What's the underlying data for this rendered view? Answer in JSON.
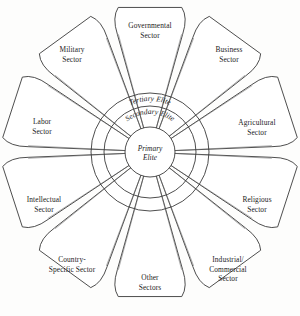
{
  "diagram": {
    "type": "radial-petal-diagram",
    "center": {
      "x": 150,
      "y": 152
    },
    "background_color": "#fdfdfc",
    "line_color": "#3a3a3a",
    "spoke_color": "#6e6e6e",
    "text_color": "#1c1c1c",
    "rings": [
      {
        "id": "tertiary",
        "label": "Tertiary Elite",
        "radius": 59,
        "label_arc_radius": 51,
        "order": 3
      },
      {
        "id": "secondary",
        "label": "Secondary Elite",
        "radius": 46,
        "label_arc_radius": 38,
        "order": 2
      },
      {
        "id": "primary",
        "label_line1": "Primary",
        "label_line2": "Elite",
        "radius": 25,
        "order": 1
      }
    ],
    "petals": [
      {
        "id": "governmental",
        "angle": -90,
        "lines": [
          "Governmental",
          "Sector"
        ],
        "label_x": 150,
        "label_y": 28
      },
      {
        "id": "business",
        "angle": -54,
        "lines": [
          "Business",
          "Sector"
        ],
        "label_x": 229,
        "label_y": 52
      },
      {
        "id": "agricultural",
        "angle": -18,
        "lines": [
          "Agricultural",
          "Sector"
        ],
        "label_x": 257,
        "label_y": 125
      },
      {
        "id": "religious",
        "angle": 18,
        "lines": [
          "Religious",
          "Sector"
        ],
        "label_x": 257,
        "label_y": 202
      },
      {
        "id": "industrial-commercial",
        "angle": 54,
        "lines": [
          "Industrial/",
          "Commercial",
          "Sector"
        ],
        "label_x": 228,
        "label_y": 262
      },
      {
        "id": "other",
        "angle": 90,
        "lines": [
          "Other",
          "Sectors"
        ],
        "label_x": 150,
        "label_y": 280
      },
      {
        "id": "country-specific",
        "angle": 126,
        "lines": [
          "Country-",
          "Specific Sector"
        ],
        "label_x": 72,
        "label_y": 262
      },
      {
        "id": "intellectual",
        "angle": 162,
        "lines": [
          "Intellectual",
          "Sector"
        ],
        "label_x": 44,
        "label_y": 202
      },
      {
        "id": "labor",
        "angle": 198,
        "lines": [
          "Labor",
          "Sector"
        ],
        "label_x": 42,
        "label_y": 124
      },
      {
        "id": "military",
        "angle": 234,
        "lines": [
          "Military",
          "Sector"
        ],
        "label_x": 72,
        "label_y": 52
      }
    ]
  }
}
